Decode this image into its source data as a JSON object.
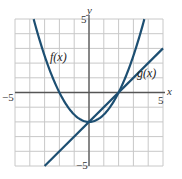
{
  "chart_data": {
    "type": "line",
    "title": "",
    "xlabel": "x",
    "ylabel": "y",
    "xlim": [
      -5,
      5
    ],
    "ylim": [
      -5,
      5
    ],
    "grid": true,
    "x_ticks_labeled": [
      -5,
      5
    ],
    "y_ticks_labeled": [
      5,
      -5
    ],
    "tick_labels": {
      "x_min": "−5",
      "x_max": "5",
      "y_max": "5",
      "y_min": "−5"
    },
    "series": [
      {
        "name": "f(x)",
        "label": "f(x)",
        "kind": "parabola",
        "formula": "f(x) = x^2/2 - 2",
        "points": [
          [
            -3.74,
            5
          ],
          [
            -3,
            2.5
          ],
          [
            -2,
            0
          ],
          [
            -1,
            -1.5
          ],
          [
            0,
            -2
          ],
          [
            1,
            -1.5
          ],
          [
            2,
            0
          ],
          [
            3,
            2.5
          ],
          [
            3.74,
            5
          ]
        ]
      },
      {
        "name": "g(x)",
        "label": "g(x)",
        "kind": "line",
        "formula": "g(x) = x - 2",
        "points": [
          [
            -3,
            -5
          ],
          [
            0,
            -2
          ],
          [
            2,
            0
          ],
          [
            5,
            3
          ]
        ]
      }
    ],
    "intersections": [
      [
        0,
        -2
      ],
      [
        2,
        0
      ]
    ],
    "line_color": "#1d4f72",
    "grid_color": "#c8c8c8",
    "axis_color": "#555555"
  }
}
